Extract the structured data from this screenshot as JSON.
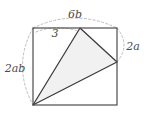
{
  "figure": {
    "type": "geometry-diagram",
    "colors": {
      "square_stroke": "#4d4d4d",
      "triangle_stroke": "#3a3a3a",
      "triangle_fill": "#f1f1f1",
      "arc_stroke": "#b5b5b5",
      "label_text": "#4a4a4a",
      "background": "#ffffff"
    },
    "square": {
      "name": "outer-square",
      "top_left": [
        33,
        28
      ],
      "top_right": [
        117,
        28
      ],
      "bottom_right": [
        117,
        105
      ],
      "bottom_left": [
        33,
        105
      ],
      "width": 84,
      "height": 77
    },
    "triangle": {
      "name": "shaded-triangle",
      "apex_top": [
        80,
        28
      ],
      "vertex_right": [
        117,
        62
      ],
      "vertex_bottom_left": [
        33,
        105
      ]
    },
    "arcs": [
      {
        "id": "arc-top",
        "label": "6b",
        "from": [
          33,
          28
        ],
        "to": [
          117,
          28
        ],
        "bulge": "up",
        "label_pos": [
          75,
          15
        ]
      },
      {
        "id": "arc-inner-top-left",
        "label": "3",
        "from": [
          36,
          31
        ],
        "to": [
          78,
          31
        ],
        "bulge": "up",
        "label_pos": [
          55,
          33
        ]
      },
      {
        "id": "arc-right",
        "label": "2a",
        "from": [
          117,
          28
        ],
        "to": [
          117,
          62
        ],
        "bulge": "right",
        "label_pos": [
          133,
          47
        ]
      },
      {
        "id": "arc-left",
        "label": "2ab",
        "from": [
          33,
          28
        ],
        "to": [
          33,
          105
        ],
        "bulge": "left",
        "label_pos": [
          14,
          68
        ]
      }
    ],
    "labels": {
      "top": "6b",
      "inner": "3",
      "right": "2a",
      "left": "2ab"
    }
  }
}
